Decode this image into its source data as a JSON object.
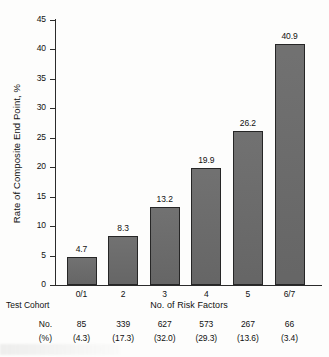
{
  "chart_data": {
    "type": "bar",
    "title": "",
    "categories": [
      "0/1",
      "2",
      "3",
      "4",
      "5",
      "6/7"
    ],
    "values": [
      4.7,
      8.3,
      13.2,
      19.9,
      26.2,
      40.9
    ],
    "value_labels": [
      "4.7",
      "8.3",
      "13.2",
      "19.9",
      "26.2",
      "40.9"
    ],
    "xlabel": "No. of Risk Factors",
    "ylabel": "Rate of Composite End Point, %",
    "ylim": [
      0,
      45
    ],
    "ytick_values": [
      0,
      5,
      10,
      15,
      20,
      25,
      30,
      35,
      40,
      45
    ],
    "ytick_labels": [
      "0",
      "5",
      "10",
      "15",
      "20",
      "25",
      "30",
      "35",
      "40",
      "45"
    ],
    "grid": false,
    "legend": null,
    "bar_color": "#6b6b6b",
    "bar_edge_color": "#262626",
    "annotations": {
      "cohort_table_title": "Test Cohort",
      "cohort_row_labels": [
        "No.",
        "(%)"
      ],
      "cohort_counts": [
        "85",
        "339",
        "627",
        "573",
        "267",
        "66"
      ],
      "cohort_percents": [
        "(4.3)",
        "(17.3)",
        "(32.0)",
        "(29.3)",
        "(13.6)",
        "(3.4)"
      ]
    }
  },
  "axes": {
    "y_title": "Rate of Composite End Point, %",
    "x_title": "No. of Risk Factors"
  },
  "cohort": {
    "title": "Test Cohort",
    "row_no_label": "No.",
    "row_pct_label": "(%)"
  }
}
